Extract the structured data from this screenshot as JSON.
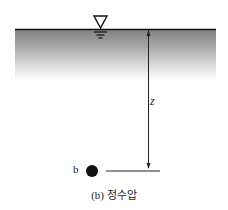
{
  "diagram": {
    "depth_label": "z",
    "point_label": "b",
    "caption": "(b) 정수압",
    "icons": {
      "surface_symbol": "water-surface-triangle-icon",
      "point": "filled-circle-point"
    },
    "colors": {
      "water_top": "#8a8a8a",
      "water_bottom": "#ffffff",
      "line": "#111111"
    }
  }
}
